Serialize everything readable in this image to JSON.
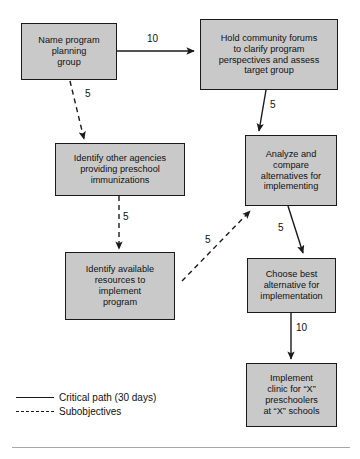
{
  "diagram": {
    "box_fill": "#c9c9c9",
    "box_border": "#1a1a1a",
    "line_color": "#1a1a1a",
    "nodes": [
      {
        "id": "name-program-planning-group",
        "label": "Name program\nplanning\ngroup"
      },
      {
        "id": "hold-community-forums",
        "label": "Hold community forums\nto clarify program\nperspectives and assess\ntarget group"
      },
      {
        "id": "identify-other-agencies",
        "label": "Identify other agencies\nproviding preschool\nimmunizations"
      },
      {
        "id": "analyze-and-compare-alternatives",
        "label": "Analyze and\ncompare\nalternatives for\nimplementing"
      },
      {
        "id": "identify-available-resources",
        "label": "Identify available\nresources to\nimplement\nprogram"
      },
      {
        "id": "choose-best-alternative",
        "label": "Choose best\nalternative for\nimplementation"
      },
      {
        "id": "implement-clinic",
        "label": "Implement\nclinic for “X”\npreschoolers\nat “X” schools"
      }
    ],
    "edges": [
      {
        "id": "edge-group-to-forums",
        "from": "name-program-planning-group",
        "to": "hold-community-forums",
        "label": "10",
        "style": "solid"
      },
      {
        "id": "edge-group-to-agencies",
        "from": "name-program-planning-group",
        "to": "identify-other-agencies",
        "label": "5",
        "style": "dashed"
      },
      {
        "id": "edge-forums-to-analyze",
        "from": "hold-community-forums",
        "to": "analyze-and-compare-alternatives",
        "label": "5",
        "style": "solid"
      },
      {
        "id": "edge-agencies-to-resources",
        "from": "identify-other-agencies",
        "to": "identify-available-resources",
        "label": "5",
        "style": "dashed"
      },
      {
        "id": "edge-resources-to-analyze",
        "from": "identify-available-resources",
        "to": "analyze-and-compare-alternatives",
        "label": "5",
        "style": "dashed"
      },
      {
        "id": "edge-analyze-to-choose",
        "from": "analyze-and-compare-alternatives",
        "to": "choose-best-alternative",
        "label": "5",
        "style": "solid"
      },
      {
        "id": "edge-choose-to-implement",
        "from": "choose-best-alternative",
        "to": "implement-clinic",
        "label": "10",
        "style": "solid"
      }
    ],
    "legend": [
      {
        "id": "legend-critical-path",
        "style": "solid",
        "label": "Critical path (30 days)"
      },
      {
        "id": "legend-subobjectives",
        "style": "dashed",
        "label": "Subobjectives"
      }
    ]
  }
}
